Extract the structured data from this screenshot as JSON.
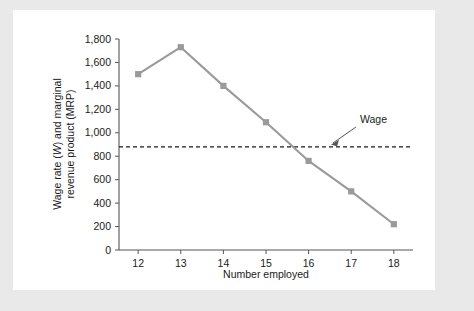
{
  "chart_data": {
    "type": "line",
    "title": "",
    "xlabel": "Number employed",
    "ylabel_part1": "Wage rate (",
    "ylabel_italic": "W",
    "ylabel_part2": ") and marginal",
    "ylabel_line2": "revenue product (MRP)",
    "ylabel": "Wage rate (W) and marginal revenue product (MRP)",
    "x": [
      12,
      13,
      14,
      15,
      16,
      17,
      18
    ],
    "categories": [
      "12",
      "13",
      "14",
      "15",
      "16",
      "17",
      "18"
    ],
    "series": [
      {
        "name": "MRP",
        "values": [
          1500,
          1730,
          1400,
          1090,
          760,
          500,
          220
        ],
        "color": "#9a9a9a",
        "marker": "square"
      }
    ],
    "annotation_lines": [
      {
        "name": "Wage",
        "label": "Wage",
        "value": 880,
        "style": "dashed",
        "color": "#1a1a1a"
      }
    ],
    "xlim": [
      11.55,
      18.45
    ],
    "ylim": [
      0,
      1800
    ],
    "yticks": [
      0,
      200,
      400,
      600,
      800,
      1000,
      1200,
      1400,
      1600,
      1800
    ],
    "ytick_labels": [
      "0",
      "200",
      "400",
      "600",
      "800",
      "1,000",
      "1,200",
      "1,400",
      "1,600",
      "1,800"
    ],
    "xticks": [
      12,
      13,
      14,
      15,
      16,
      17,
      18
    ],
    "xtick_labels": [
      "12",
      "13",
      "14",
      "15",
      "16",
      "17",
      "18"
    ],
    "grid": false,
    "legend": "none",
    "axis_color": "#555555",
    "background": "#ffffff",
    "page_background": "#e9e9e9"
  }
}
